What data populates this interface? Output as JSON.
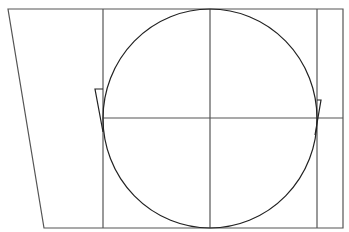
{
  "diagram": {
    "stroke_color": "#555555",
    "curve_color": "#222222",
    "background": "#ffffff",
    "outline": {
      "top_left": [
        8,
        9
      ],
      "top_right": [
        343,
        9
      ],
      "bottom_right": [
        343,
        228
      ],
      "bottom_left": [
        44,
        228
      ]
    },
    "vertical_lines_x": [
      103,
      210,
      317
    ],
    "horizontal_line_y": 118,
    "circle": {
      "cx": 210,
      "cy": 118.5,
      "rx": 107,
      "ry": 109.5
    },
    "left_bracket": {
      "points": [
        [
          103,
          89
        ],
        [
          95,
          89
        ],
        [
          103,
          132
        ]
      ]
    },
    "right_bracket": {
      "points": [
        [
          317,
          100
        ],
        [
          321,
          100
        ],
        [
          315,
          135
        ]
      ]
    }
  }
}
